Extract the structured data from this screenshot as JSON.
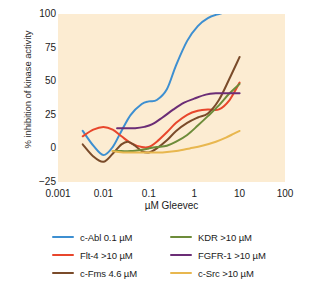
{
  "chart_data": {
    "type": "line",
    "title": "",
    "xlabel": "µM Gleevec",
    "ylabel": "% inhibition of kinase activity",
    "xscale": "log",
    "xlim": [
      0.001,
      100
    ],
    "ylim": [
      -25,
      100
    ],
    "xticks": [
      "0.001",
      "0.01",
      "0.1",
      "1",
      "10",
      "100"
    ],
    "xtick_values": [
      0.001,
      0.01,
      0.1,
      1,
      10,
      100
    ],
    "yticks": [
      "100",
      "75",
      "50",
      "25",
      "0",
      "−25"
    ],
    "ytick_values": [
      100,
      75,
      50,
      25,
      0,
      -25
    ],
    "grid": false,
    "legend_position": "below",
    "plot_background": "#fcecd2",
    "series": [
      {
        "name": "c-Abl 0.1 µM",
        "color": "#3d8fd1",
        "x": [
          0.0035,
          0.006,
          0.01,
          0.016,
          0.025,
          0.04,
          0.07,
          0.1,
          0.15,
          0.25,
          0.4,
          0.7,
          1.2,
          2.0,
          3.5,
          6.0,
          10.0
        ],
        "y": [
          13,
          2,
          -5,
          1,
          13,
          25,
          33,
          35,
          36,
          44,
          62,
          80,
          91,
          97,
          100,
          102,
          103
        ]
      },
      {
        "name": "Flt-4 >10 µM",
        "color": "#e8462c",
        "x": [
          0.0035,
          0.006,
          0.01,
          0.016,
          0.025,
          0.04,
          0.07,
          0.1,
          0.15,
          0.25,
          0.4,
          0.7,
          1.2,
          2.0,
          3.5,
          6.0,
          10.0
        ],
        "y": [
          9,
          14,
          16,
          14,
          9,
          4,
          1,
          1,
          5,
          12,
          19,
          25,
          28,
          29,
          29,
          36,
          49
        ]
      },
      {
        "name": "c-Fms 4.6 µM",
        "color": "#7a4b2a",
        "x": [
          0.0035,
          0.006,
          0.01,
          0.016,
          0.025,
          0.035,
          0.05,
          0.07,
          0.1,
          0.15,
          0.25,
          0.4,
          0.7,
          1.2,
          2.0,
          3.5,
          6.0,
          10.0
        ],
        "y": [
          3,
          -6,
          -10,
          -4,
          3,
          5,
          2,
          -2,
          -3,
          0,
          6,
          13,
          19,
          23,
          26,
          36,
          52,
          68
        ]
      },
      {
        "name": "KDR >10 µM",
        "color": "#6d8c3a",
        "x": [
          0.016,
          0.025,
          0.04,
          0.07,
          0.1,
          0.15,
          0.25,
          0.4,
          0.7,
          1.2,
          2.0,
          3.5,
          6.0,
          10.0
        ],
        "y": [
          -2,
          -2,
          -2,
          -1,
          0,
          1,
          2,
          5,
          10,
          17,
          24,
          32,
          41,
          48
        ]
      },
      {
        "name": "FGFR-1 >10 µM",
        "color": "#6b2d76],",
        "x": [
          0.02,
          0.03,
          0.05,
          0.08,
          0.12,
          0.2,
          0.35,
          0.6,
          1.0,
          1.8,
          3.0,
          5.0,
          8.0,
          10.0
        ],
        "y": [
          15,
          15,
          15,
          16,
          18,
          23,
          29,
          34,
          37,
          40,
          41,
          41,
          41,
          41
        ]
      },
      {
        "name": "c-Src >10 µM",
        "color": "#e8b74f",
        "x": [
          0.016,
          0.03,
          0.06,
          0.1,
          0.2,
          0.4,
          0.8,
          1.5,
          3.0,
          5.0,
          7.5,
          10.0
        ],
        "y": [
          -2,
          -3,
          -3,
          -3,
          -3,
          -2,
          0,
          2,
          5,
          8,
          11,
          13
        ]
      }
    ]
  },
  "legend": {
    "left_column": [
      {
        "label": "c-Abl 0.1 µM",
        "color": "#3d8fd1"
      },
      {
        "label": "Flt-4 >10 µM",
        "color": "#e8462c"
      },
      {
        "label": "c-Fms 4.6 µM",
        "color": "#7a4b2a"
      }
    ],
    "right_column": [
      {
        "label": "KDR >10 µM",
        "color": "#6d8c3a"
      },
      {
        "label": "FGFR-1 >10 µM",
        "color": "#6b2d76"
      },
      {
        "label": "c-Src >10 µM",
        "color": "#e8b74f"
      }
    ]
  }
}
